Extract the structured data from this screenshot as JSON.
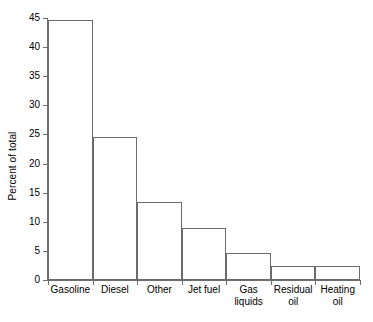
{
  "chart_data": {
    "type": "bar",
    "title": "",
    "xlabel": "",
    "ylabel": "Percent of total",
    "categories": [
      "Gasoline",
      "Diesel",
      "Other",
      "Jet fuel",
      "Gas liquids",
      "Residual oil",
      "Heating oil"
    ],
    "category_lines": [
      [
        "Gasoline"
      ],
      [
        "Diesel"
      ],
      [
        "Other"
      ],
      [
        "Jet fuel"
      ],
      [
        "Gas",
        "liquids"
      ],
      [
        "Residual",
        "oil"
      ],
      [
        "Heating",
        "oil"
      ]
    ],
    "values": [
      44.6,
      24.5,
      13.4,
      9.0,
      4.6,
      2.4,
      2.4
    ],
    "ylim": [
      0,
      45
    ],
    "ytick_values": [
      0,
      5,
      10,
      15,
      20,
      25,
      30,
      35,
      40,
      45
    ],
    "ytick_labels": [
      "0",
      "5",
      "10",
      "15",
      "20",
      "25",
      "30",
      "35",
      "40",
      "45"
    ],
    "grid": false,
    "legend": null,
    "bar_fill_color": "#ffffff",
    "bar_edge_color": "#6b6b6b",
    "axis_color": "#6f6f6f",
    "background_color": "#ffffff"
  }
}
